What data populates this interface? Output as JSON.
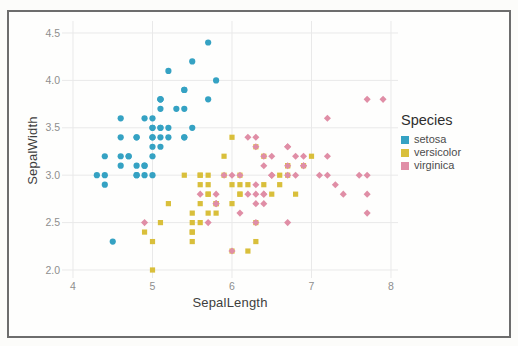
{
  "legend": {
    "title": "Species"
  },
  "colors": {
    "setosa": "#35a2c3",
    "versicolor": "#d9bf3b",
    "virginica": "#e08ea6",
    "grid": "#e9e9e9",
    "frame": "#6d6d6d",
    "tick_text": "#8e8e8e",
    "axis_label_text": "#3e3e3e"
  },
  "chart_data": {
    "type": "scatter",
    "title": "",
    "xlabel": "SepalLength",
    "ylabel": "SepalWidth",
    "xlim": [
      3.85,
      8.1
    ],
    "ylim": [
      1.93,
      4.62
    ],
    "x_ticks": [
      4,
      5,
      6,
      7,
      8
    ],
    "x_tick_labels": [
      "4",
      "5",
      "6",
      "7",
      "8"
    ],
    "y_ticks": [
      2.0,
      2.5,
      3.0,
      3.5,
      4.0,
      4.5
    ],
    "y_tick_labels": [
      "2.0",
      "2.5",
      "3.0",
      "3.5",
      "4.0",
      "4.5"
    ],
    "grid": true,
    "legend_position": "right",
    "series": [
      {
        "name": "setosa",
        "marker": "circle",
        "color": "#35a2c3",
        "points": [
          [
            5.1,
            3.5
          ],
          [
            4.9,
            3.0
          ],
          [
            4.7,
            3.2
          ],
          [
            4.6,
            3.1
          ],
          [
            5.0,
            3.6
          ],
          [
            5.4,
            3.9
          ],
          [
            4.6,
            3.4
          ],
          [
            5.0,
            3.4
          ],
          [
            4.4,
            2.9
          ],
          [
            4.9,
            3.1
          ],
          [
            5.4,
            3.7
          ],
          [
            4.8,
            3.4
          ],
          [
            4.8,
            3.0
          ],
          [
            4.3,
            3.0
          ],
          [
            5.8,
            4.0
          ],
          [
            5.7,
            4.4
          ],
          [
            5.4,
            3.9
          ],
          [
            5.1,
            3.5
          ],
          [
            5.7,
            3.8
          ],
          [
            5.1,
            3.8
          ],
          [
            5.4,
            3.4
          ],
          [
            5.1,
            3.7
          ],
          [
            4.6,
            3.6
          ],
          [
            5.1,
            3.3
          ],
          [
            4.8,
            3.4
          ],
          [
            5.0,
            3.0
          ],
          [
            5.0,
            3.4
          ],
          [
            5.2,
            3.5
          ],
          [
            5.2,
            3.4
          ],
          [
            4.7,
            3.2
          ],
          [
            4.8,
            3.1
          ],
          [
            5.4,
            3.4
          ],
          [
            5.2,
            4.1
          ],
          [
            5.5,
            4.2
          ],
          [
            4.9,
            3.1
          ],
          [
            5.0,
            3.2
          ],
          [
            5.5,
            3.5
          ],
          [
            4.9,
            3.6
          ],
          [
            4.4,
            3.0
          ],
          [
            5.1,
            3.4
          ],
          [
            5.0,
            3.5
          ],
          [
            4.5,
            2.3
          ],
          [
            4.4,
            3.2
          ],
          [
            5.0,
            3.5
          ],
          [
            5.1,
            3.8
          ],
          [
            4.8,
            3.0
          ],
          [
            5.1,
            3.8
          ],
          [
            4.6,
            3.2
          ],
          [
            5.3,
            3.7
          ],
          [
            5.0,
            3.3
          ]
        ]
      },
      {
        "name": "versicolor",
        "marker": "square",
        "color": "#d9bf3b",
        "points": [
          [
            7.0,
            3.2
          ],
          [
            6.4,
            3.2
          ],
          [
            6.9,
            3.1
          ],
          [
            5.5,
            2.3
          ],
          [
            6.5,
            2.8
          ],
          [
            5.7,
            2.8
          ],
          [
            6.3,
            3.3
          ],
          [
            4.9,
            2.4
          ],
          [
            6.6,
            2.9
          ],
          [
            5.2,
            2.7
          ],
          [
            5.0,
            2.0
          ],
          [
            5.9,
            3.0
          ],
          [
            6.0,
            2.2
          ],
          [
            6.1,
            2.9
          ],
          [
            5.6,
            2.9
          ],
          [
            6.7,
            3.1
          ],
          [
            5.6,
            3.0
          ],
          [
            5.8,
            2.7
          ],
          [
            6.2,
            2.2
          ],
          [
            5.6,
            2.5
          ],
          [
            5.9,
            3.2
          ],
          [
            6.1,
            2.8
          ],
          [
            6.3,
            2.5
          ],
          [
            6.1,
            2.8
          ],
          [
            6.4,
            2.9
          ],
          [
            6.6,
            3.0
          ],
          [
            6.8,
            2.8
          ],
          [
            6.7,
            3.0
          ],
          [
            6.0,
            2.9
          ],
          [
            5.7,
            2.6
          ],
          [
            5.5,
            2.4
          ],
          [
            5.5,
            2.4
          ],
          [
            5.8,
            2.7
          ],
          [
            6.0,
            2.7
          ],
          [
            5.4,
            3.0
          ],
          [
            6.0,
            3.4
          ],
          [
            6.7,
            3.1
          ],
          [
            6.3,
            2.3
          ],
          [
            5.6,
            3.0
          ],
          [
            5.5,
            2.5
          ],
          [
            5.5,
            2.6
          ],
          [
            6.1,
            3.0
          ],
          [
            5.8,
            2.6
          ],
          [
            5.0,
            2.3
          ],
          [
            5.6,
            2.7
          ],
          [
            5.7,
            3.0
          ],
          [
            5.7,
            2.9
          ],
          [
            6.2,
            2.9
          ],
          [
            5.1,
            2.5
          ],
          [
            5.7,
            2.8
          ]
        ]
      },
      {
        "name": "virginica",
        "marker": "diamond",
        "color": "#e08ea6",
        "points": [
          [
            6.3,
            3.3
          ],
          [
            5.8,
            2.7
          ],
          [
            7.1,
            3.0
          ],
          [
            6.3,
            2.9
          ],
          [
            6.5,
            3.0
          ],
          [
            7.6,
            3.0
          ],
          [
            4.9,
            2.5
          ],
          [
            7.3,
            2.9
          ],
          [
            6.7,
            2.5
          ],
          [
            7.2,
            3.6
          ],
          [
            6.5,
            3.2
          ],
          [
            6.4,
            2.7
          ],
          [
            6.8,
            3.0
          ],
          [
            5.7,
            2.5
          ],
          [
            5.8,
            2.8
          ],
          [
            6.4,
            3.2
          ],
          [
            6.5,
            3.0
          ],
          [
            7.7,
            3.8
          ],
          [
            7.7,
            2.6
          ],
          [
            6.0,
            2.2
          ],
          [
            6.9,
            3.2
          ],
          [
            5.6,
            2.8
          ],
          [
            7.7,
            2.8
          ],
          [
            6.3,
            2.7
          ],
          [
            6.7,
            3.3
          ],
          [
            7.2,
            3.2
          ],
          [
            6.2,
            2.8
          ],
          [
            6.1,
            3.0
          ],
          [
            6.4,
            2.8
          ],
          [
            7.2,
            3.0
          ],
          [
            7.4,
            2.8
          ],
          [
            7.9,
            3.8
          ],
          [
            6.4,
            2.8
          ],
          [
            6.3,
            2.8
          ],
          [
            6.1,
            2.6
          ],
          [
            7.7,
            3.0
          ],
          [
            6.3,
            3.4
          ],
          [
            6.4,
            3.1
          ],
          [
            6.0,
            3.0
          ],
          [
            6.9,
            3.1
          ],
          [
            6.7,
            3.1
          ],
          [
            6.9,
            3.1
          ],
          [
            5.8,
            2.7
          ],
          [
            6.8,
            3.2
          ],
          [
            6.7,
            3.3
          ],
          [
            6.7,
            3.0
          ],
          [
            6.3,
            2.5
          ],
          [
            6.5,
            3.0
          ],
          [
            6.2,
            3.4
          ],
          [
            5.9,
            3.0
          ]
        ]
      }
    ]
  }
}
